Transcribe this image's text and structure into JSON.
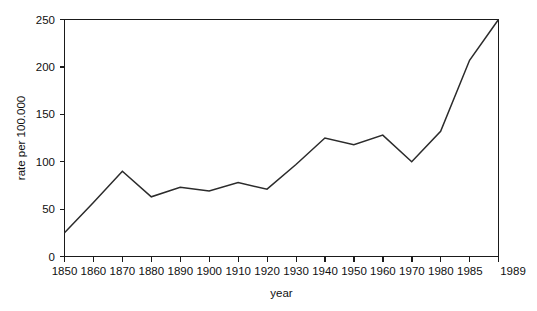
{
  "chart_data": {
    "type": "line",
    "title": "",
    "xlabel": "year",
    "ylabel": "rate per 100.000",
    "xlim": [
      1850,
      1989
    ],
    "ylim": [
      0,
      250
    ],
    "grid": false,
    "legend": "none",
    "x_tick_labels": [
      "1850",
      "1860",
      "1870",
      "1880",
      "1890",
      "1900",
      "1910",
      "1920",
      "1930",
      "1940",
      "1950",
      "1960",
      "1970",
      "1980",
      "1985",
      "1989"
    ],
    "y_tick_labels": [
      "0",
      "50",
      "100",
      "150",
      "200",
      "250"
    ],
    "y_ticks": [
      0,
      50,
      100,
      150,
      200,
      250
    ],
    "categories": [
      1850,
      1860,
      1870,
      1880,
      1890,
      1900,
      1910,
      1920,
      1930,
      1940,
      1950,
      1960,
      1970,
      1980,
      1985,
      1989
    ],
    "values": [
      25,
      57,
      90,
      63,
      73,
      69,
      78,
      71,
      97,
      125,
      118,
      128,
      100,
      132,
      207,
      250
    ],
    "series": [
      {
        "name": "rate per 100.000",
        "points": [
          {
            "x": "1850",
            "y": 25
          },
          {
            "x": "1860",
            "y": 57
          },
          {
            "x": "1870",
            "y": 90
          },
          {
            "x": "1880",
            "y": 63
          },
          {
            "x": "1890",
            "y": 73
          },
          {
            "x": "1900",
            "y": 69
          },
          {
            "x": "1910",
            "y": 78
          },
          {
            "x": "1920",
            "y": 71
          },
          {
            "x": "1930",
            "y": 97
          },
          {
            "x": "1940",
            "y": 125
          },
          {
            "x": "1950",
            "y": 118
          },
          {
            "x": "1960",
            "y": 128
          },
          {
            "x": "1970",
            "y": 100
          },
          {
            "x": "1980",
            "y": 132
          },
          {
            "x": "1985",
            "y": 207
          },
          {
            "x": "1989",
            "y": 250
          }
        ]
      }
    ],
    "colors": {
      "line": "#2b2b2b",
      "axis": "#1a1a1a",
      "text": "#101010",
      "background": "#ffffff"
    },
    "notes": {
      "axis_spacing": "x-axis tick positions are evenly spaced despite unequal year intervals at the right end (1980, 1985, 1989)"
    }
  }
}
